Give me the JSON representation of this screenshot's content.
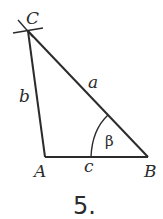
{
  "diagram": {
    "type": "triangle",
    "figure_number": "5.",
    "vertices": {
      "A": {
        "label": "A",
        "x": 45,
        "y": 157
      },
      "B": {
        "label": "B",
        "x": 148,
        "y": 157
      },
      "C": {
        "label": "C",
        "x": 28,
        "y": 31
      }
    },
    "sides": {
      "a": {
        "label": "a",
        "between": [
          "B",
          "C"
        ]
      },
      "b": {
        "label": "b",
        "between": [
          "A",
          "C"
        ]
      },
      "c": {
        "label": "c",
        "between": [
          "A",
          "B"
        ]
      }
    },
    "angle": {
      "label": "β",
      "at": "B"
    },
    "colors": {
      "stroke": "#2b2b2b",
      "background": "#ffffff"
    }
  }
}
